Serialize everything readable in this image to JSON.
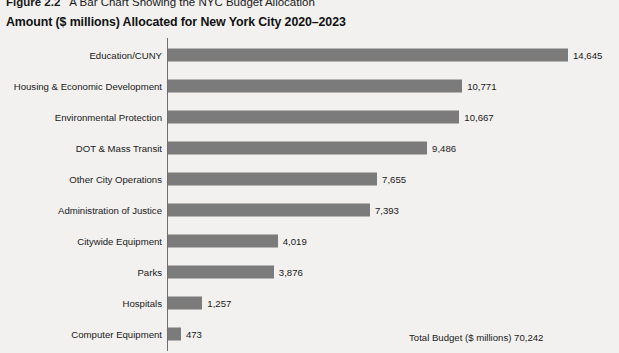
{
  "caption": {
    "figure_number": "Figure 2.2",
    "figure_title": "A Bar Chart Showing the NYC Budget Allocation"
  },
  "subtitle": "Amount ($ millions) Allocated for New York City 2020–2023",
  "footnote": "Total Budget ($ millions) 70,242",
  "colors": {
    "bar": "#7b7b7b",
    "axis": "#6e6e6e",
    "background": "#f2f1ef",
    "text": "#1a1a1a"
  },
  "chart_data": {
    "type": "bar",
    "orientation": "horizontal",
    "title": "Amount ($ millions) Allocated for New York City 2020–2023",
    "xlabel": "",
    "ylabel": "",
    "grid": false,
    "legend": false,
    "xlim": [
      0,
      14645
    ],
    "total_label": "Total Budget ($ millions) 70,242",
    "total": 70242,
    "categories": [
      "Education/CUNY",
      "Housing & Economic Development",
      "Environmental Protection",
      "DOT & Mass Transit",
      "Other City Operations",
      "Administration of Justice",
      "Citywide Equipment",
      "Parks",
      "Hospitals",
      "Computer Equipment"
    ],
    "values": [
      14645,
      10771,
      10667,
      9486,
      7655,
      7393,
      4019,
      3876,
      1257,
      473
    ],
    "value_labels": [
      "14,645",
      "10,771",
      "10,667",
      "9,486",
      "7,655",
      "7,393",
      "4,019",
      "3,876",
      "1,257",
      "473"
    ],
    "bars": [
      {
        "label": "Education/CUNY",
        "value": 14645,
        "value_label": "14,645"
      },
      {
        "label": "Housing & Economic Development",
        "value": 10771,
        "value_label": "10,771"
      },
      {
        "label": "Environmental Protection",
        "value": 10667,
        "value_label": "10,667"
      },
      {
        "label": "DOT & Mass Transit",
        "value": 9486,
        "value_label": "9,486"
      },
      {
        "label": "Other City Operations",
        "value": 7655,
        "value_label": "7,655"
      },
      {
        "label": "Administration of Justice",
        "value": 7393,
        "value_label": "7,393"
      },
      {
        "label": "Citywide Equipment",
        "value": 4019,
        "value_label": "4,019"
      },
      {
        "label": "Parks",
        "value": 3876,
        "value_label": "3,876"
      },
      {
        "label": "Hospitals",
        "value": 1257,
        "value_label": "1,257"
      },
      {
        "label": "Computer Equipment",
        "value": 473,
        "value_label": "473"
      }
    ]
  }
}
